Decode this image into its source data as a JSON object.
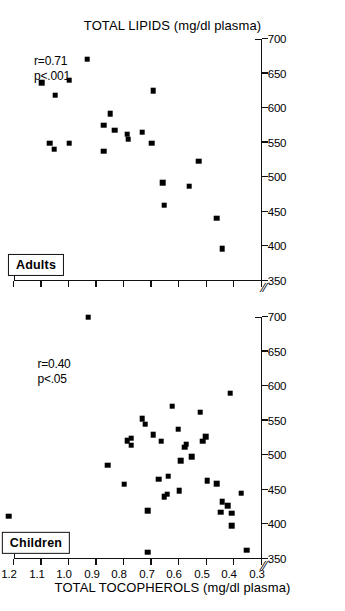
{
  "figure": {
    "orientation_note": "rotated-90",
    "axis_title_x": "TOTAL LIPIDS (mg/dl plasma)",
    "axis_title_y": "TOTAL TOCOPHEROLS (mg/dl plasma)",
    "axis_break_glyph": "⁄⁄"
  },
  "chart_data": {
    "type": "scatter",
    "title": "",
    "xlabel": "TOTAL LIPIDS (mg/dl plasma)",
    "ylabel": "TOTAL TOCOPHEROLS (mg/dl plasma)",
    "xlim": [
      350,
      700
    ],
    "ylim": [
      0.3,
      1.2
    ],
    "xticks": [
      350,
      400,
      450,
      500,
      550,
      600,
      650,
      700
    ],
    "yticks": [
      0.3,
      0.4,
      0.5,
      0.6,
      0.7,
      0.8,
      0.9,
      1.0,
      1.1,
      1.2
    ],
    "xtick_labels": [
      "350",
      "400",
      "450",
      "500",
      "550",
      "600",
      "650",
      "700"
    ],
    "ytick_labels": [
      "0.3",
      "0.4",
      "0.5",
      "0.6",
      "0.7",
      "0.8",
      "0.9",
      "1.0",
      "1.1",
      "1.2"
    ],
    "grid": false,
    "legend": "none",
    "axis_break_x_at_origin": true,
    "axis_break_y_at_origin": true,
    "panels": [
      {
        "name": "children",
        "label": "Children",
        "stats_r": "r=0.40",
        "stats_p": "p<.05",
        "marker": "filled-square",
        "points": [
          [
            412,
            1.22
          ],
          [
            700,
            0.93
          ],
          [
            486,
            0.86
          ],
          [
            458,
            0.8
          ],
          [
            521,
            0.79
          ],
          [
            515,
            0.775
          ],
          [
            525,
            0.775
          ],
          [
            553,
            0.735
          ],
          [
            545,
            0.725
          ],
          [
            420,
            0.715
          ],
          [
            360,
            0.715
          ],
          [
            530,
            0.695
          ],
          [
            465,
            0.675
          ],
          [
            520,
            0.665
          ],
          [
            440,
            0.655
          ],
          [
            444,
            0.645
          ],
          [
            470,
            0.64
          ],
          [
            571,
            0.625
          ],
          [
            538,
            0.605
          ],
          [
            449,
            0.6
          ],
          [
            492,
            0.595
          ],
          [
            512,
            0.58
          ],
          [
            516,
            0.575
          ],
          [
            498,
            0.555
          ],
          [
            562,
            0.525
          ],
          [
            520,
            0.515
          ],
          [
            527,
            0.505
          ],
          [
            463,
            0.5
          ],
          [
            459,
            0.465
          ],
          [
            418,
            0.45
          ],
          [
            433,
            0.445
          ],
          [
            427,
            0.425
          ],
          [
            590,
            0.415
          ],
          [
            416,
            0.41
          ],
          [
            398,
            0.41
          ],
          [
            445,
            0.375
          ],
          [
            363,
            0.355
          ]
        ]
      },
      {
        "name": "adults",
        "label": "Adults",
        "stats_r": "r=0.71",
        "stats_p": "p<.001",
        "marker": "filled-square",
        "points": [
          [
            637,
            1.1
          ],
          [
            640,
            1.0
          ],
          [
            619,
            1.05
          ],
          [
            671,
            0.935
          ],
          [
            549,
            1.07
          ],
          [
            541,
            1.055
          ],
          [
            549,
            1.0
          ],
          [
            575,
            0.875
          ],
          [
            538,
            0.875
          ],
          [
            592,
            0.85
          ],
          [
            568,
            0.835
          ],
          [
            562,
            0.79
          ],
          [
            555,
            0.785
          ],
          [
            565,
            0.735
          ],
          [
            549,
            0.7
          ],
          [
            625,
            0.695
          ],
          [
            492,
            0.66
          ],
          [
            460,
            0.655
          ],
          [
            487,
            0.565
          ],
          [
            523,
            0.53
          ],
          [
            441,
            0.465
          ],
          [
            397,
            0.445
          ]
        ]
      }
    ]
  }
}
